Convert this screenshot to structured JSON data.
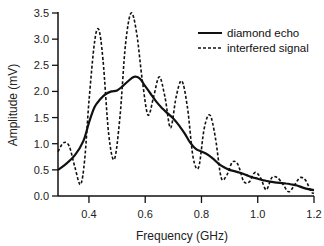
{
  "chart_data": {
    "type": "line",
    "title": "",
    "xlabel": "Frequency (GHz)",
    "ylabel": "Amplitude (mV)",
    "xlim": [
      0.29,
      1.2
    ],
    "ylim": [
      0.0,
      3.5
    ],
    "xticks": [
      "0.4",
      "0.6",
      "0.8",
      "1.0",
      "1.2"
    ],
    "yticks": [
      "0.0",
      "0.5",
      "1.0",
      "1.5",
      "2.0",
      "2.5",
      "3.0",
      "3.5"
    ],
    "grid": false,
    "legend_position": "upper right",
    "series": [
      {
        "name": "diamond echo",
        "style": "solid",
        "x": [
          0.29,
          0.32,
          0.35,
          0.38,
          0.4,
          0.42,
          0.44,
          0.46,
          0.48,
          0.5,
          0.52,
          0.54,
          0.56,
          0.58,
          0.6,
          0.62,
          0.64,
          0.66,
          0.68,
          0.7,
          0.72,
          0.74,
          0.76,
          0.78,
          0.8,
          0.82,
          0.84,
          0.86,
          0.88,
          0.9,
          0.92,
          0.94,
          0.96,
          0.98,
          1.0,
          1.02,
          1.04,
          1.06,
          1.08,
          1.1,
          1.12,
          1.14,
          1.16,
          1.18,
          1.2
        ],
        "values": [
          0.5,
          0.62,
          0.78,
          1.05,
          1.4,
          1.7,
          1.85,
          1.95,
          2.0,
          2.02,
          2.1,
          2.2,
          2.28,
          2.25,
          2.1,
          1.95,
          1.8,
          1.68,
          1.58,
          1.48,
          1.35,
          1.2,
          1.02,
          0.9,
          0.85,
          0.8,
          0.72,
          0.62,
          0.55,
          0.5,
          0.47,
          0.44,
          0.4,
          0.36,
          0.33,
          0.3,
          0.28,
          0.26,
          0.25,
          0.24,
          0.22,
          0.2,
          0.16,
          0.13,
          0.11
        ]
      },
      {
        "name": "interfered signal",
        "style": "dashed",
        "x": [
          0.29,
          0.31,
          0.33,
          0.35,
          0.37,
          0.385,
          0.4,
          0.42,
          0.435,
          0.45,
          0.47,
          0.49,
          0.51,
          0.53,
          0.55,
          0.57,
          0.59,
          0.61,
          0.63,
          0.65,
          0.67,
          0.69,
          0.71,
          0.73,
          0.75,
          0.77,
          0.79,
          0.81,
          0.83,
          0.85,
          0.87,
          0.89,
          0.91,
          0.93,
          0.95,
          0.97,
          0.99,
          1.01,
          1.03,
          1.05,
          1.07,
          1.09,
          1.11,
          1.13,
          1.15,
          1.17,
          1.19,
          1.2
        ],
        "values": [
          0.85,
          1.02,
          0.95,
          0.55,
          0.22,
          0.7,
          1.8,
          2.95,
          3.18,
          2.6,
          1.2,
          0.7,
          1.5,
          2.9,
          3.5,
          3.1,
          2.2,
          1.55,
          1.9,
          2.28,
          1.9,
          1.3,
          1.9,
          2.2,
          1.7,
          0.75,
          0.55,
          1.3,
          1.55,
          1.1,
          0.35,
          0.4,
          0.65,
          0.6,
          0.28,
          0.27,
          0.45,
          0.35,
          0.12,
          0.35,
          0.35,
          0.22,
          0.08,
          0.2,
          0.35,
          0.3,
          0.08,
          0.05
        ]
      }
    ]
  }
}
